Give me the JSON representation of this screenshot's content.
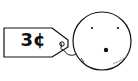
{
  "cartoon": {
    "price_tag": {
      "label": "3¢"
    },
    "face": {
      "expression": "surprised"
    },
    "signature": "",
    "colors": {
      "ink": "#111111",
      "background": "#ffffff"
    }
  }
}
